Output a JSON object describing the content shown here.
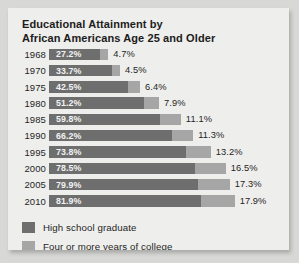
{
  "chart_data": {
    "type": "bar",
    "title": "Educational Attainment by\nAfrican Americans Age 25 and Older",
    "xlabel": "",
    "ylabel": "",
    "orientation": "horizontal",
    "stacked": true,
    "grid": false,
    "legend_position": "bottom-left",
    "categories": [
      "1968",
      "1970",
      "1975",
      "1980",
      "1985",
      "1990",
      "1995",
      "2000",
      "2005",
      "2010"
    ],
    "series": [
      {
        "name": "High school graduate",
        "color": "#6e6e6e",
        "values": [
          27.2,
          33.7,
          42.5,
          51.2,
          59.8,
          66.2,
          73.8,
          78.5,
          79.9,
          81.9
        ],
        "labels": [
          "27.2%",
          "33.7%",
          "42.5%",
          "51.2%",
          "59.8%",
          "66.2%",
          "73.8%",
          "78.5%",
          "79.9%",
          "81.9%"
        ]
      },
      {
        "name": "Four or more years of college",
        "color": "#a6a6a6",
        "values": [
          4.7,
          4.5,
          6.4,
          7.9,
          11.1,
          11.3,
          13.2,
          16.5,
          17.3,
          17.9
        ],
        "labels": [
          "4.7%",
          "4.5%",
          "6.4%",
          "7.9%",
          "11.1%",
          "11.3%",
          "13.2%",
          "16.5%",
          "17.3%",
          "17.9%"
        ]
      }
    ],
    "xlim": [
      0,
      100
    ],
    "value_unit": "percent"
  },
  "legend": {
    "items": [
      {
        "label": "High school graduate",
        "color": "#6e6e6e"
      },
      {
        "label": "Four or more years of college",
        "color": "#a6a6a6"
      }
    ]
  },
  "colors": {
    "panel_background": "#eeeeec",
    "page_background": "#d8d8d6",
    "high_school": "#6e6e6e",
    "college": "#a6a6a6",
    "text": "#1f1f1f"
  }
}
